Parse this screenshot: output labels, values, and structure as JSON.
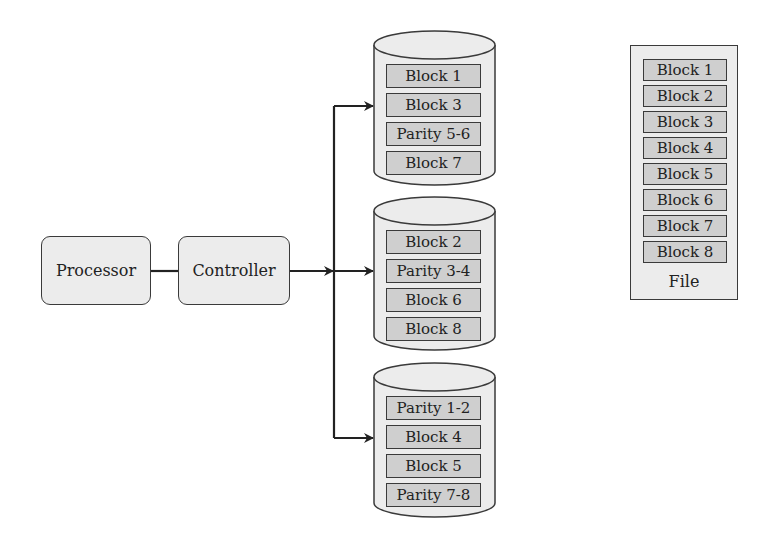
{
  "diagram": {
    "colors": {
      "stroke": "#3a3a3a",
      "node_fill": "#ececec",
      "block_fill": "#cfcfcf",
      "background": "#ffffff"
    },
    "nodes": {
      "processor": {
        "label": "Processor"
      },
      "controller": {
        "label": "Controller"
      }
    },
    "disks": [
      {
        "blocks": [
          "Block 1",
          "Block 3",
          "Parity 5-6",
          "Block 7"
        ]
      },
      {
        "blocks": [
          "Block 2",
          "Parity 3-4",
          "Block 6",
          "Block 8"
        ]
      },
      {
        "blocks": [
          "Parity 1-2",
          "Block 4",
          "Block 5",
          "Parity 7-8"
        ]
      }
    ],
    "file": {
      "label": "File",
      "blocks": [
        "Block 1",
        "Block 2",
        "Block 3",
        "Block 4",
        "Block 5",
        "Block 6",
        "Block 7",
        "Block 8"
      ]
    }
  }
}
